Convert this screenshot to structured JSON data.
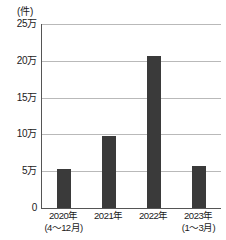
{
  "chart_data": {
    "type": "bar",
    "title": "",
    "subtitle": "",
    "xlabel": "",
    "ylabel": "(件)",
    "unit_label": "(件)",
    "categories": [
      "2020年",
      "2021年",
      "2022年",
      "2023年"
    ],
    "category_sublabels": [
      "(4〜12月)",
      "",
      "",
      "(1〜3月)"
    ],
    "values": [
      53000,
      98000,
      207000,
      57000
    ],
    "value_labels": [
      "5.3万",
      "9.8万",
      "20.7万",
      "5.7万"
    ],
    "ylim": [
      0,
      250000
    ],
    "yticks": [
      0,
      50000,
      100000,
      150000,
      200000,
      250000
    ],
    "ytick_labels": [
      "0",
      "5万",
      "10万",
      "15万",
      "20万",
      "25万"
    ],
    "grid": true,
    "grid_axis": "y",
    "legend": false,
    "legend_position": "none",
    "colors": {
      "bar": "#3a3a3a",
      "gridline": "#b9b9b9",
      "axis": "#555555",
      "text": "#1a1a1a",
      "background": "#ffffff"
    }
  }
}
